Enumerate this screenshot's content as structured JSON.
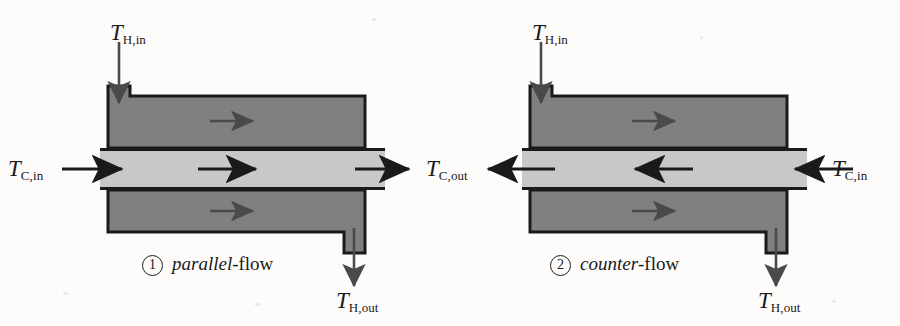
{
  "figure": {
    "background_color": "#fdfcfa",
    "hot_channel_color": "#808080",
    "cold_channel_color": "#c8c8c8",
    "outline_color": "#1a1a1a",
    "arrow_color": "#4a4a4a",
    "label_color": "#1a1a1a"
  },
  "panels": [
    {
      "id": "parallel-flow",
      "number": "1",
      "caption_italic": "parallel",
      "caption_upright": "-flow",
      "hot_flow_direction": "right",
      "cold_flow_direction": "right",
      "labels": {
        "hot_in": {
          "symbol": "T",
          "subscript": "H,in"
        },
        "hot_out": {
          "symbol": "T",
          "subscript": "H,out"
        },
        "cold_in": {
          "symbol": "T",
          "subscript": "C,in"
        },
        "cold_out": {
          "symbol": "T",
          "subscript": "C,out"
        }
      }
    },
    {
      "id": "counter-flow",
      "number": "2",
      "caption_italic": "counter",
      "caption_upright": "-flow",
      "hot_flow_direction": "right",
      "cold_flow_direction": "left",
      "labels": {
        "hot_in": {
          "symbol": "T",
          "subscript": "H,in"
        },
        "hot_out": {
          "symbol": "T",
          "subscript": "H,out"
        },
        "cold_in": {
          "symbol": "T",
          "subscript": "C,in"
        },
        "cold_out": {
          "symbol": "T",
          "subscript": "C,out"
        }
      }
    }
  ]
}
